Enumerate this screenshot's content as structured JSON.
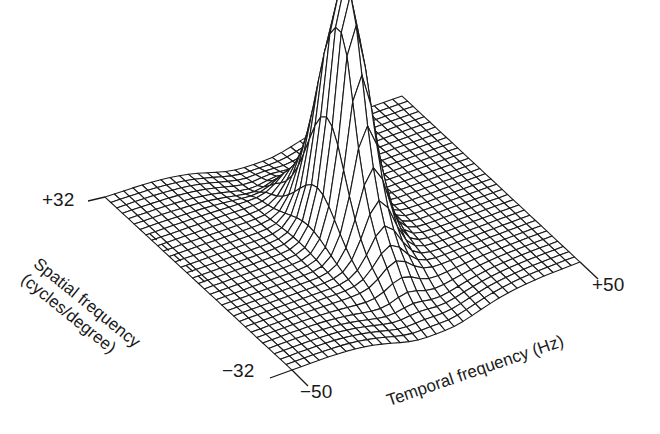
{
  "chart_data": {
    "type": "surface3d",
    "title": "",
    "axes": {
      "spatial": {
        "label_line1": "Spatial frequency",
        "label_line2": "(cycles/degree)",
        "range": [
          -32,
          32
        ],
        "ticks": [
          "+32",
          "−32"
        ]
      },
      "temporal": {
        "label": "Temporal frequency (Hz)",
        "range": [
          -50,
          50
        ],
        "ticks": [
          "−50",
          "+50"
        ]
      }
    },
    "grid": {
      "spatial_lines": 33,
      "temporal_lines": 33
    },
    "peak": {
      "spatial": 0,
      "temporal": 0,
      "relative_height": 1.0,
      "secondary_lobe": true
    },
    "colors": {
      "line": "#1a1a1a",
      "fill": "#ffffff"
    }
  },
  "labels": {
    "spatial_max": "+32",
    "spatial_min": "−32",
    "temporal_min": "−50",
    "temporal_max": "+50",
    "spatial_title_1": "Spatial frequency",
    "spatial_title_2": "(cycles/degree)",
    "temporal_title": "Temporal frequency (Hz)"
  }
}
